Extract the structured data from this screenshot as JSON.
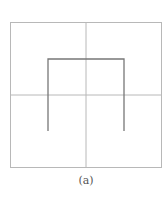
{
  "figure": {
    "caption": "(a)",
    "colors": {
      "grid": "#b8b8b8",
      "curve": "#777777",
      "background": "#ffffff"
    },
    "grid": {
      "rows": 2,
      "cols": 2
    },
    "curve": {
      "order": 1,
      "points_in_grid_units": [
        [
          0.5,
          1.5
        ],
        [
          0.5,
          0.5
        ],
        [
          1.5,
          0.5
        ],
        [
          1.5,
          1.5
        ]
      ]
    }
  }
}
